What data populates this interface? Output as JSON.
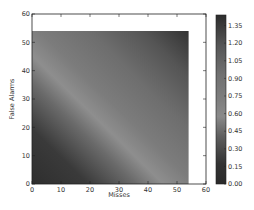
{
  "chart_data": {
    "type": "heatmap",
    "title": "",
    "xlabel": "Misses",
    "ylabel": "False Alarms",
    "xlim": [
      0,
      60
    ],
    "ylim": [
      0,
      60
    ],
    "xticks": [
      0,
      10,
      20,
      30,
      40,
      50,
      60
    ],
    "yticks": [
      0,
      10,
      20,
      30,
      40,
      50,
      60
    ],
    "data_extent": {
      "x": [
        0,
        54
      ],
      "y": [
        0,
        54
      ]
    },
    "grid": false,
    "colormap": "jet (rendered in grayscale)",
    "colorbar": {
      "position": "right",
      "range": [
        0.0,
        1.44
      ],
      "ticks": [
        0.0,
        0.15,
        0.3,
        0.45,
        0.6,
        0.75,
        0.9,
        1.05,
        1.2,
        1.35
      ],
      "tick_labels": [
        "0.00",
        "0.15",
        "0.30",
        "0.45",
        "0.60",
        "0.75",
        "0.90",
        "1.05",
        "1.20",
        "1.35"
      ]
    },
    "sample_values": [
      {
        "x": 0,
        "y": 0,
        "value": 0.0
      },
      {
        "x": 20,
        "y": 0,
        "value": 0.2
      },
      {
        "x": 0,
        "y": 20,
        "value": 0.25
      },
      {
        "x": 0,
        "y": 30,
        "value": 0.5
      },
      {
        "x": 40,
        "y": 0,
        "value": 0.45
      },
      {
        "x": 54,
        "y": 0,
        "value": 0.6
      },
      {
        "x": 27,
        "y": 27,
        "value": 0.75
      },
      {
        "x": 0,
        "y": 54,
        "value": 0.9
      },
      {
        "x": 54,
        "y": 27,
        "value": 1.05
      },
      {
        "x": 54,
        "y": 54,
        "value": 1.4
      }
    ]
  },
  "axes": {
    "x_tick_labels": [
      "0",
      "10",
      "20",
      "30",
      "40",
      "50",
      "60"
    ],
    "y_tick_labels": [
      "0",
      "10",
      "20",
      "30",
      "40",
      "50",
      "60"
    ],
    "xlabel": "Misses",
    "ylabel": "False Alarms"
  }
}
